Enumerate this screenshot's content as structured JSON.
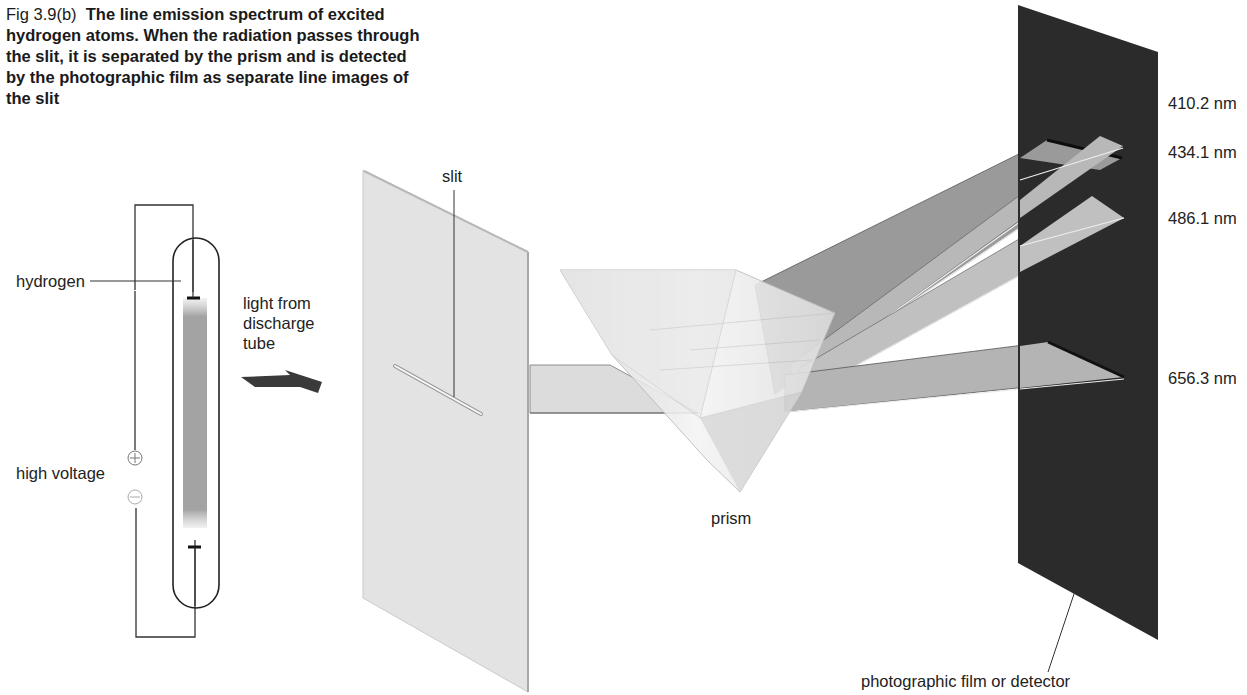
{
  "caption": {
    "figure_number": "Fig 3.9(b)",
    "text": "The line emission spectrum of excited hydrogen atoms. When the radiation passes through the slit, it is separated by the prism and is detected by the photographic film as separate line images of the slit"
  },
  "labels": {
    "hydrogen": "hydrogen",
    "high_voltage": "high voltage",
    "light_source": "light from discharge tube",
    "slit": "slit",
    "prism": "prism",
    "detector": "photographic film or detector",
    "plus_symbol": "+",
    "minus_symbol": "−"
  },
  "spectral_lines": [
    {
      "wavelength": "410.2 nm"
    },
    {
      "wavelength": "434.1 nm"
    },
    {
      "wavelength": "486.1 nm"
    },
    {
      "wavelength": "656.3 nm"
    }
  ],
  "colors": {
    "screen": "#e4e4e4",
    "detector": "#2b2b2b",
    "beam_dark": "#8e8e8e",
    "beam_mid": "#a8a8a8",
    "beam_light": "#bcbcbc",
    "prism": "#eeeeee",
    "line": "#333333"
  }
}
